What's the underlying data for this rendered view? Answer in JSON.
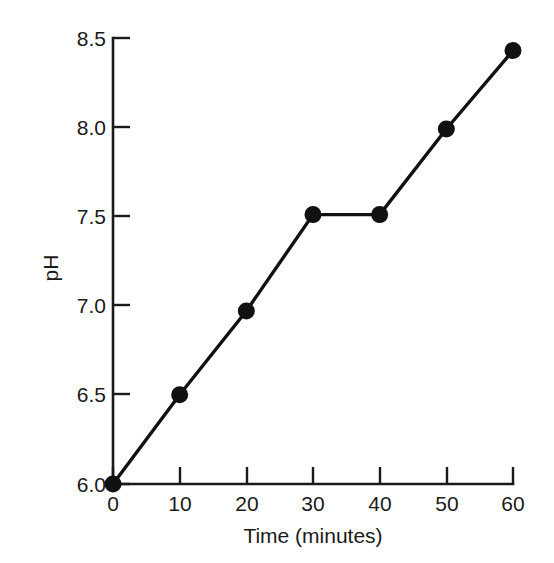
{
  "chart_data": {
    "type": "line",
    "title": "",
    "xlabel": "Time (minutes)",
    "ylabel": "pH",
    "x": [
      0,
      10,
      20,
      30,
      40,
      50,
      60
    ],
    "values": [
      6.0,
      6.5,
      6.97,
      7.51,
      7.51,
      7.99,
      8.43
    ],
    "series": [
      {
        "name": "pH",
        "x": [
          0,
          10,
          20,
          30,
          40,
          50,
          60
        ],
        "values": [
          6.0,
          6.5,
          6.97,
          7.51,
          7.51,
          7.99,
          8.43
        ]
      }
    ],
    "xlim": [
      0,
      60
    ],
    "ylim": [
      6.0,
      8.5
    ],
    "xticks": [
      0,
      10,
      20,
      30,
      40,
      50,
      60
    ],
    "yticks": [
      6.0,
      6.5,
      7.0,
      7.5,
      8.0,
      8.5
    ],
    "xtick_labels": [
      "0",
      "10",
      "20",
      "30",
      "40",
      "50",
      "60"
    ],
    "ytick_labels": [
      "6.0",
      "6.5",
      "7.0",
      "7.5",
      "8.0",
      "8.5"
    ],
    "grid": false,
    "legend": false,
    "legend_position": "none",
    "marker": "filled-circle",
    "line_color": "#111111",
    "marker_color": "#111111",
    "background_color": "#ffffff",
    "annotations": []
  },
  "axes": {
    "x_title": "Time (minutes)",
    "y_title": "pH",
    "x_ticks": [
      {
        "label": "0",
        "value": 0
      },
      {
        "label": "10",
        "value": 10
      },
      {
        "label": "20",
        "value": 20
      },
      {
        "label": "30",
        "value": 30
      },
      {
        "label": "40",
        "value": 40
      },
      {
        "label": "50",
        "value": 50
      },
      {
        "label": "60",
        "value": 60
      }
    ],
    "y_ticks": [
      {
        "label": "6.0",
        "value": 6.0
      },
      {
        "label": "6.5",
        "value": 6.5
      },
      {
        "label": "7.0",
        "value": 7.0
      },
      {
        "label": "7.5",
        "value": 7.5
      },
      {
        "label": "8.0",
        "value": 8.0
      },
      {
        "label": "8.5",
        "value": 8.5
      }
    ]
  }
}
